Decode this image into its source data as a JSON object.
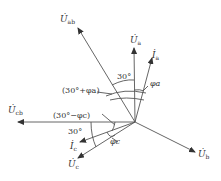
{
  "diagram": {
    "type": "phasor-diagram",
    "origin": [
      135,
      122
    ],
    "line_color": "#444444",
    "text_color": "#333333"
  },
  "phasors": {
    "U_ab": {
      "symbol": "U̇",
      "sub": "ab",
      "tip": [
        78,
        28
      ]
    },
    "U_a": {
      "symbol": "U̇",
      "sub": "a",
      "tip": [
        133,
        48
      ]
    },
    "I_a": {
      "symbol": "İ",
      "sub": "a",
      "tip": [
        152,
        58
      ]
    },
    "U_cb": {
      "symbol": "U̇",
      "sub": "cb",
      "tip": [
        18,
        122
      ]
    },
    "I_c": {
      "symbol": "İ",
      "sub": "c",
      "tip": [
        80,
        142
      ]
    },
    "U_c": {
      "symbol": "U̇",
      "sub": "c",
      "tip": [
        78,
        158
      ]
    },
    "U_b": {
      "symbol": "U̇",
      "sub": "b",
      "tip": [
        195,
        152
      ]
    }
  },
  "angles": {
    "top_30": "30°",
    "phi_a": "φa",
    "thirty_plus_phi_a": "(30°+φa)",
    "thirty_minus_phi_c": "(30°−φc)",
    "bottom_30": "30°",
    "phi_c": "φc"
  }
}
